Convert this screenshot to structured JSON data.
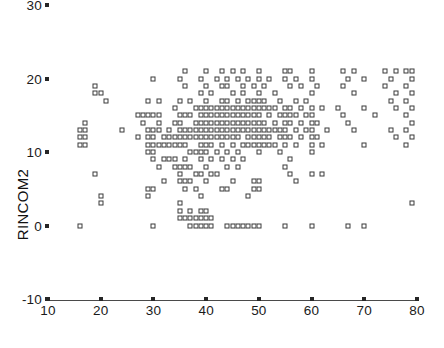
{
  "chart_data": {
    "type": "scatter",
    "title": "",
    "xlabel": "",
    "ylabel": "RINCOM2",
    "xlim": [
      10,
      80
    ],
    "ylim": [
      -10,
      30
    ],
    "xticks": [
      10,
      20,
      30,
      40,
      50,
      60,
      70,
      80
    ],
    "yticks": [
      -10,
      0,
      10,
      20,
      30
    ],
    "xtick_labels": [
      "10",
      "20",
      "30",
      "40",
      "50",
      "60",
      "70",
      "80"
    ],
    "ytick_labels": [
      "-10",
      "0",
      "10",
      "20",
      "30"
    ],
    "grid": false,
    "legend": null,
    "marker": "open-square",
    "marker_color": "#3a3a3a",
    "marker_fill": "#ffffff",
    "axis_color": "#4a4a4a",
    "background": "#ffffff",
    "points": [
      [
        16,
        13
      ],
      [
        16,
        12
      ],
      [
        16,
        11
      ],
      [
        16,
        0
      ],
      [
        17,
        14
      ],
      [
        17,
        13
      ],
      [
        17,
        12
      ],
      [
        17,
        11
      ],
      [
        19,
        19
      ],
      [
        19,
        18
      ],
      [
        19,
        7
      ],
      [
        20,
        18
      ],
      [
        20,
        4
      ],
      [
        20,
        3
      ],
      [
        21,
        17
      ],
      [
        24,
        13
      ],
      [
        27,
        15
      ],
      [
        27,
        12
      ],
      [
        28,
        15
      ],
      [
        28,
        14
      ],
      [
        29,
        17
      ],
      [
        29,
        15
      ],
      [
        29,
        13
      ],
      [
        29,
        12
      ],
      [
        29,
        11
      ],
      [
        29,
        10
      ],
      [
        29,
        5
      ],
      [
        29,
        4
      ],
      [
        30,
        20
      ],
      [
        30,
        15
      ],
      [
        30,
        13
      ],
      [
        30,
        12
      ],
      [
        30,
        11
      ],
      [
        30,
        10
      ],
      [
        30,
        9
      ],
      [
        30,
        5
      ],
      [
        30,
        0
      ],
      [
        31,
        17
      ],
      [
        31,
        15
      ],
      [
        31,
        14
      ],
      [
        31,
        13
      ],
      [
        31,
        11
      ],
      [
        31,
        8
      ],
      [
        32,
        12
      ],
      [
        32,
        11
      ],
      [
        32,
        9
      ],
      [
        32,
        6
      ],
      [
        33,
        13
      ],
      [
        33,
        12
      ],
      [
        33,
        11
      ],
      [
        33,
        9
      ],
      [
        34,
        16
      ],
      [
        34,
        14
      ],
      [
        34,
        12
      ],
      [
        34,
        11
      ],
      [
        34,
        9
      ],
      [
        34,
        8
      ],
      [
        35,
        20
      ],
      [
        35,
        17
      ],
      [
        35,
        15
      ],
      [
        35,
        14
      ],
      [
        35,
        13
      ],
      [
        35,
        12
      ],
      [
        35,
        11
      ],
      [
        35,
        8
      ],
      [
        35,
        7
      ],
      [
        35,
        6
      ],
      [
        35,
        3
      ],
      [
        35,
        2
      ],
      [
        35,
        1
      ],
      [
        36,
        21
      ],
      [
        36,
        19
      ],
      [
        36,
        15
      ],
      [
        36,
        13
      ],
      [
        36,
        12
      ],
      [
        36,
        11
      ],
      [
        36,
        9
      ],
      [
        36,
        8
      ],
      [
        36,
        6
      ],
      [
        36,
        5
      ],
      [
        36,
        1
      ],
      [
        37,
        17
      ],
      [
        37,
        15
      ],
      [
        37,
        13
      ],
      [
        37,
        12
      ],
      [
        37,
        10
      ],
      [
        37,
        8
      ],
      [
        37,
        6
      ],
      [
        37,
        2
      ],
      [
        37,
        1
      ],
      [
        37,
        0
      ],
      [
        38,
        16
      ],
      [
        38,
        14
      ],
      [
        38,
        13
      ],
      [
        38,
        12
      ],
      [
        38,
        10
      ],
      [
        38,
        7
      ],
      [
        38,
        5
      ],
      [
        38,
        1
      ],
      [
        38,
        0
      ],
      [
        39,
        20
      ],
      [
        39,
        18
      ],
      [
        39,
        16
      ],
      [
        39,
        15
      ],
      [
        39,
        14
      ],
      [
        39,
        13
      ],
      [
        39,
        12
      ],
      [
        39,
        11
      ],
      [
        39,
        10
      ],
      [
        39,
        9
      ],
      [
        39,
        7
      ],
      [
        39,
        4
      ],
      [
        39,
        2
      ],
      [
        39,
        1
      ],
      [
        39,
        0
      ],
      [
        40,
        21
      ],
      [
        40,
        19
      ],
      [
        40,
        17
      ],
      [
        40,
        16
      ],
      [
        40,
        15
      ],
      [
        40,
        14
      ],
      [
        40,
        13
      ],
      [
        40,
        12
      ],
      [
        40,
        11
      ],
      [
        40,
        10
      ],
      [
        40,
        8
      ],
      [
        40,
        6
      ],
      [
        40,
        2
      ],
      [
        40,
        1
      ],
      [
        40,
        0
      ],
      [
        41,
        18
      ],
      [
        41,
        16
      ],
      [
        41,
        15
      ],
      [
        41,
        14
      ],
      [
        41,
        13
      ],
      [
        41,
        12
      ],
      [
        41,
        11
      ],
      [
        41,
        9
      ],
      [
        41,
        7
      ],
      [
        41,
        1
      ],
      [
        41,
        0
      ],
      [
        42,
        20
      ],
      [
        42,
        16
      ],
      [
        42,
        15
      ],
      [
        42,
        14
      ],
      [
        42,
        13
      ],
      [
        42,
        12
      ],
      [
        42,
        10
      ],
      [
        42,
        7
      ],
      [
        43,
        21
      ],
      [
        43,
        19
      ],
      [
        43,
        17
      ],
      [
        43,
        16
      ],
      [
        43,
        15
      ],
      [
        43,
        14
      ],
      [
        43,
        13
      ],
      [
        43,
        12
      ],
      [
        43,
        11
      ],
      [
        43,
        9
      ],
      [
        43,
        5
      ],
      [
        44,
        20
      ],
      [
        44,
        19
      ],
      [
        44,
        17
      ],
      [
        44,
        16
      ],
      [
        44,
        15
      ],
      [
        44,
        14
      ],
      [
        44,
        13
      ],
      [
        44,
        12
      ],
      [
        44,
        10
      ],
      [
        44,
        8
      ],
      [
        44,
        5
      ],
      [
        44,
        0
      ],
      [
        45,
        21
      ],
      [
        45,
        18
      ],
      [
        45,
        16
      ],
      [
        45,
        15
      ],
      [
        45,
        14
      ],
      [
        45,
        13
      ],
      [
        45,
        12
      ],
      [
        45,
        11
      ],
      [
        45,
        9
      ],
      [
        45,
        6
      ],
      [
        45,
        0
      ],
      [
        46,
        20
      ],
      [
        46,
        17
      ],
      [
        46,
        16
      ],
      [
        46,
        15
      ],
      [
        46,
        14
      ],
      [
        46,
        13
      ],
      [
        46,
        12
      ],
      [
        46,
        10
      ],
      [
        46,
        8
      ],
      [
        46,
        0
      ],
      [
        47,
        21
      ],
      [
        47,
        19
      ],
      [
        47,
        18
      ],
      [
        47,
        16
      ],
      [
        47,
        15
      ],
      [
        47,
        14
      ],
      [
        47,
        13
      ],
      [
        47,
        11
      ],
      [
        47,
        9
      ],
      [
        47,
        0
      ],
      [
        48,
        20
      ],
      [
        48,
        17
      ],
      [
        48,
        16
      ],
      [
        48,
        15
      ],
      [
        48,
        14
      ],
      [
        48,
        13
      ],
      [
        48,
        12
      ],
      [
        48,
        11
      ],
      [
        48,
        4
      ],
      [
        48,
        0
      ],
      [
        49,
        19
      ],
      [
        49,
        17
      ],
      [
        49,
        16
      ],
      [
        49,
        15
      ],
      [
        49,
        14
      ],
      [
        49,
        13
      ],
      [
        49,
        12
      ],
      [
        49,
        11
      ],
      [
        49,
        6
      ],
      [
        49,
        5
      ],
      [
        49,
        0
      ],
      [
        50,
        21
      ],
      [
        50,
        20
      ],
      [
        50,
        18
      ],
      [
        50,
        17
      ],
      [
        50,
        16
      ],
      [
        50,
        15
      ],
      [
        50,
        14
      ],
      [
        50,
        13
      ],
      [
        50,
        12
      ],
      [
        50,
        11
      ],
      [
        50,
        10
      ],
      [
        50,
        6
      ],
      [
        50,
        5
      ],
      [
        50,
        0
      ],
      [
        51,
        19
      ],
      [
        51,
        17
      ],
      [
        51,
        16
      ],
      [
        51,
        14
      ],
      [
        51,
        13
      ],
      [
        51,
        12
      ],
      [
        51,
        11
      ],
      [
        52,
        20
      ],
      [
        52,
        16
      ],
      [
        52,
        15
      ],
      [
        52,
        13
      ],
      [
        52,
        12
      ],
      [
        52,
        11
      ],
      [
        53,
        18
      ],
      [
        53,
        16
      ],
      [
        53,
        14
      ],
      [
        53,
        13
      ],
      [
        53,
        11
      ],
      [
        54,
        17
      ],
      [
        54,
        15
      ],
      [
        54,
        13
      ],
      [
        54,
        12
      ],
      [
        54,
        10
      ],
      [
        55,
        21
      ],
      [
        55,
        20
      ],
      [
        55,
        16
      ],
      [
        55,
        15
      ],
      [
        55,
        14
      ],
      [
        55,
        13
      ],
      [
        55,
        12
      ],
      [
        55,
        11
      ],
      [
        55,
        8
      ],
      [
        55,
        0
      ],
      [
        56,
        21
      ],
      [
        56,
        19
      ],
      [
        56,
        16
      ],
      [
        56,
        15
      ],
      [
        56,
        14
      ],
      [
        56,
        12
      ],
      [
        56,
        9
      ],
      [
        56,
        7
      ],
      [
        57,
        20
      ],
      [
        57,
        17
      ],
      [
        57,
        15
      ],
      [
        57,
        13
      ],
      [
        57,
        11
      ],
      [
        57,
        6
      ],
      [
        58,
        19
      ],
      [
        58,
        16
      ],
      [
        58,
        14
      ],
      [
        58,
        12
      ],
      [
        59,
        17
      ],
      [
        59,
        15
      ],
      [
        59,
        13
      ],
      [
        60,
        21
      ],
      [
        60,
        20
      ],
      [
        60,
        18
      ],
      [
        60,
        16
      ],
      [
        60,
        15
      ],
      [
        60,
        14
      ],
      [
        60,
        13
      ],
      [
        60,
        12
      ],
      [
        60,
        11
      ],
      [
        60,
        10
      ],
      [
        60,
        7
      ],
      [
        60,
        0
      ],
      [
        61,
        19
      ],
      [
        61,
        14
      ],
      [
        61,
        12
      ],
      [
        62,
        16
      ],
      [
        62,
        11
      ],
      [
        62,
        7
      ],
      [
        63,
        13
      ],
      [
        65,
        16
      ],
      [
        66,
        21
      ],
      [
        66,
        19
      ],
      [
        66,
        15
      ],
      [
        67,
        20
      ],
      [
        67,
        14
      ],
      [
        67,
        0
      ],
      [
        68,
        21
      ],
      [
        68,
        18
      ],
      [
        68,
        13
      ],
      [
        70,
        20
      ],
      [
        70,
        16
      ],
      [
        70,
        11
      ],
      [
        70,
        0
      ],
      [
        72,
        15
      ],
      [
        74,
        21
      ],
      [
        74,
        19
      ],
      [
        75,
        20
      ],
      [
        75,
        17
      ],
      [
        75,
        13
      ],
      [
        76,
        21
      ],
      [
        76,
        18
      ],
      [
        76,
        16
      ],
      [
        76,
        12
      ],
      [
        78,
        21
      ],
      [
        78,
        19
      ],
      [
        78,
        17
      ],
      [
        78,
        15
      ],
      [
        78,
        13
      ],
      [
        78,
        11
      ],
      [
        79,
        21
      ],
      [
        79,
        20
      ],
      [
        79,
        18
      ],
      [
        79,
        16
      ],
      [
        79,
        14
      ],
      [
        79,
        12
      ],
      [
        79,
        3
      ]
    ]
  }
}
